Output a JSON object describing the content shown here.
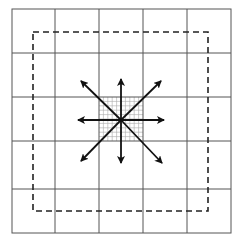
{
  "diagram": {
    "title": "",
    "grid": {
      "cols": 5,
      "rows": 5,
      "line_color": "#555555"
    },
    "dashed_boundary": {
      "color": "#222222"
    },
    "center_fine_grid": {
      "subdivisions": 10,
      "color": "#999999"
    },
    "arrows": {
      "count": 8,
      "directions": [
        "up",
        "up-right",
        "right",
        "down-right",
        "down",
        "down-left",
        "left",
        "up-left"
      ],
      "color": "#111111"
    }
  }
}
